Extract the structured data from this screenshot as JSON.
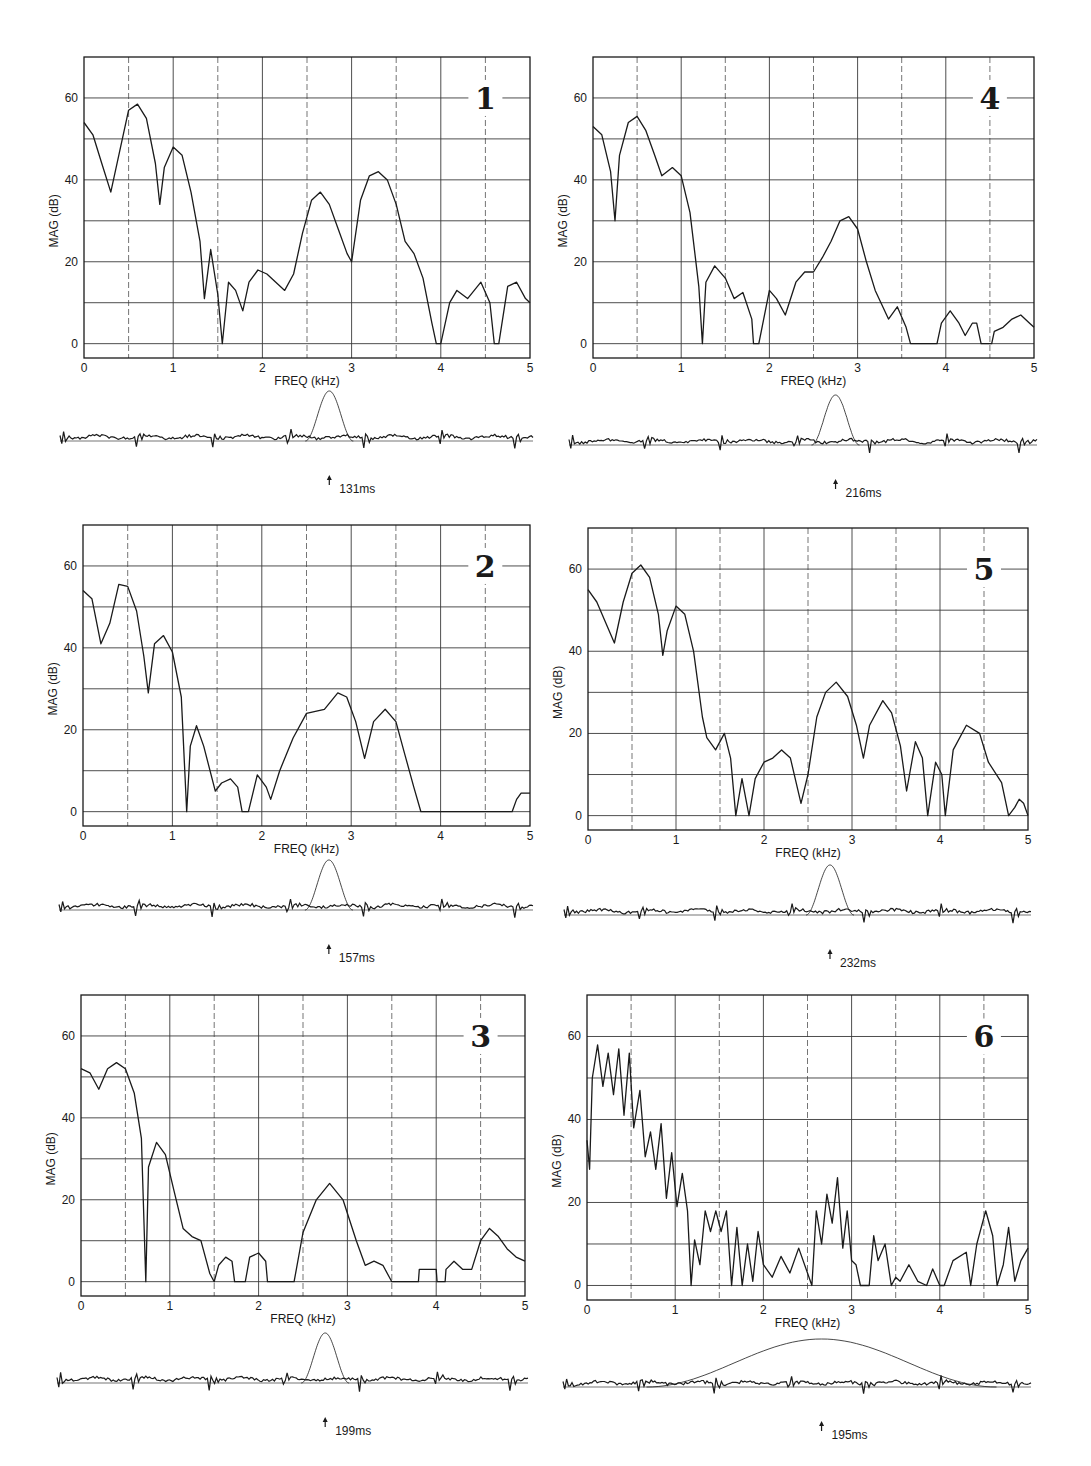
{
  "figure": {
    "x_axis_label": "FREQ (kHz)",
    "y_axis_label": "MAG  (dB)",
    "x_ticks": [
      "0",
      "1",
      "2",
      "3",
      "4",
      "5"
    ],
    "y_ticks": [
      "0",
      "20",
      "40",
      "60"
    ],
    "colors": {
      "ink": "#1a1a1a",
      "grid": "#3a3a3a",
      "background": "#ffffff"
    }
  },
  "chart_data": [
    {
      "type": "line",
      "panel": "1",
      "title": "1",
      "xlabel": "FREQ (kHz)",
      "ylabel": "MAG (dB)",
      "xlim": [
        0,
        5
      ],
      "ylim": [
        -3.5,
        70
      ],
      "x_ticks": [
        0,
        1,
        2,
        3,
        4,
        5
      ],
      "y_ticks": [
        0,
        20,
        40,
        60
      ],
      "grid": true,
      "x": [
        0,
        0.1,
        0.2,
        0.3,
        0.4,
        0.5,
        0.6,
        0.7,
        0.8,
        0.85,
        0.9,
        1.0,
        1.1,
        1.2,
        1.3,
        1.35,
        1.42,
        1.5,
        1.55,
        1.62,
        1.7,
        1.78,
        1.85,
        1.95,
        2.05,
        2.15,
        2.25,
        2.35,
        2.45,
        2.55,
        2.65,
        2.75,
        2.85,
        2.95,
        3.0,
        3.1,
        3.2,
        3.3,
        3.4,
        3.5,
        3.6,
        3.7,
        3.8,
        3.9,
        3.95,
        4.0,
        4.1,
        4.18,
        4.3,
        4.45,
        4.55,
        4.6,
        4.65,
        4.75,
        4.85,
        4.95,
        5.0
      ],
      "values": [
        54,
        51,
        44,
        37,
        47,
        57,
        58.5,
        55,
        44,
        34,
        43,
        48,
        46,
        37,
        25,
        11,
        23,
        12,
        0,
        15,
        13,
        8,
        15,
        18,
        17,
        15,
        13,
        17,
        27,
        35,
        37,
        34,
        28,
        22,
        20,
        35,
        41,
        42,
        40,
        34,
        25,
        22,
        16,
        5,
        0,
        0,
        10,
        13,
        11,
        15,
        10,
        0,
        0,
        14,
        15,
        11,
        10
      ],
      "annotation_time": "131ms"
    },
    {
      "type": "line",
      "panel": "2",
      "title": "2",
      "xlabel": "FREQ (kHz)",
      "ylabel": "MAG (dB)",
      "xlim": [
        0,
        5
      ],
      "ylim": [
        -3.5,
        70
      ],
      "x_ticks": [
        0,
        1,
        2,
        3,
        4,
        5
      ],
      "y_ticks": [
        0,
        20,
        40,
        60
      ],
      "grid": true,
      "x": [
        0,
        0.1,
        0.2,
        0.3,
        0.4,
        0.5,
        0.6,
        0.68,
        0.73,
        0.8,
        0.9,
        1.0,
        1.1,
        1.16,
        1.2,
        1.27,
        1.35,
        1.48,
        1.55,
        1.65,
        1.73,
        1.78,
        1.85,
        1.95,
        2.05,
        2.1,
        2.2,
        2.35,
        2.5,
        2.6,
        2.7,
        2.85,
        2.95,
        3.05,
        3.15,
        3.25,
        3.38,
        3.5,
        3.6,
        3.7,
        3.78,
        4.0,
        4.5,
        4.8,
        4.85,
        4.9,
        5.0
      ],
      "values": [
        54,
        52,
        41,
        46,
        55.5,
        55,
        49,
        38,
        29,
        41,
        43,
        39,
        28,
        0,
        16,
        21,
        16,
        5,
        7,
        8,
        6,
        0,
        0,
        9,
        6,
        3,
        10,
        18,
        24,
        24.5,
        25,
        29,
        28,
        22,
        13,
        22,
        25,
        22,
        14,
        6,
        0,
        0,
        0,
        0,
        3,
        4.5,
        4.5
      ],
      "annotation_time": "157ms"
    },
    {
      "type": "line",
      "panel": "3",
      "title": "3",
      "xlabel": "FREQ (kHz)",
      "ylabel": "MAG (dB)",
      "xlim": [
        0,
        5
      ],
      "ylim": [
        -3.5,
        70
      ],
      "x_ticks": [
        0,
        1,
        2,
        3,
        4,
        5
      ],
      "y_ticks": [
        0,
        20,
        40,
        60
      ],
      "grid": true,
      "x": [
        0,
        0.1,
        0.2,
        0.3,
        0.4,
        0.5,
        0.6,
        0.68,
        0.73,
        0.76,
        0.85,
        0.95,
        1.05,
        1.15,
        1.25,
        1.35,
        1.45,
        1.5,
        1.55,
        1.63,
        1.7,
        1.73,
        1.85,
        1.9,
        2.0,
        2.08,
        2.1,
        2.4,
        2.5,
        2.65,
        2.8,
        2.95,
        3.1,
        3.2,
        3.3,
        3.4,
        3.5,
        3.8,
        3.81,
        4.0,
        4.01,
        4.1,
        4.11,
        4.2,
        4.3,
        4.4,
        4.5,
        4.6,
        4.7,
        4.8,
        4.9,
        5.0
      ],
      "values": [
        52,
        51,
        47,
        52,
        53.5,
        52,
        46,
        35,
        0,
        28,
        34,
        31,
        22,
        13,
        11,
        10,
        2,
        0,
        4,
        6,
        5,
        0,
        0,
        6,
        7,
        5,
        0,
        0,
        12,
        20,
        24,
        20,
        10,
        4,
        5,
        4,
        0,
        0,
        3,
        3,
        0,
        0,
        3,
        5,
        3,
        3,
        10,
        13,
        11,
        8,
        6,
        5
      ],
      "annotation_time": "199ms"
    },
    {
      "type": "line",
      "panel": "4",
      "title": "4",
      "xlabel": "FREQ (kHz)",
      "ylabel": "MAG (dB)",
      "xlim": [
        0,
        5
      ],
      "ylim": [
        -3.5,
        70
      ],
      "x_ticks": [
        0,
        1,
        2,
        3,
        4,
        5
      ],
      "y_ticks": [
        0,
        20,
        40,
        60
      ],
      "grid": true,
      "x": [
        0,
        0.1,
        0.2,
        0.25,
        0.3,
        0.4,
        0.5,
        0.6,
        0.7,
        0.78,
        0.9,
        1.0,
        1.1,
        1.2,
        1.24,
        1.28,
        1.38,
        1.5,
        1.6,
        1.7,
        1.8,
        1.82,
        1.88,
        2.0,
        2.08,
        2.18,
        2.3,
        2.4,
        2.5,
        2.6,
        2.7,
        2.8,
        2.9,
        3.0,
        3.1,
        3.2,
        3.35,
        3.45,
        3.55,
        3.6,
        3.9,
        3.95,
        4.05,
        4.15,
        4.22,
        4.3,
        4.35,
        4.4,
        4.52,
        4.55,
        4.65,
        4.75,
        4.85,
        4.95,
        5.0
      ],
      "values": [
        53,
        51,
        42,
        30,
        46,
        54,
        55.5,
        52,
        46,
        41,
        43,
        41,
        32,
        14,
        0,
        15,
        19,
        16,
        11,
        12.5,
        6,
        0,
        0,
        13,
        11,
        7,
        15,
        17.5,
        17.5,
        21,
        25,
        30,
        31,
        28,
        20,
        13,
        6,
        9,
        4,
        0,
        0,
        5,
        8,
        5,
        2,
        5,
        5,
        0,
        0,
        3,
        4,
        6,
        7,
        5,
        4
      ],
      "annotation_time": "216ms"
    },
    {
      "type": "line",
      "panel": "5",
      "title": "5",
      "xlabel": "FREQ (kHz)",
      "ylabel": "MAG (dB)",
      "xlim": [
        0,
        5
      ],
      "ylim": [
        -3.5,
        70
      ],
      "x_ticks": [
        0,
        1,
        2,
        3,
        4,
        5
      ],
      "y_ticks": [
        0,
        20,
        40,
        60
      ],
      "grid": true,
      "x": [
        0,
        0.1,
        0.2,
        0.3,
        0.4,
        0.5,
        0.6,
        0.7,
        0.8,
        0.85,
        0.9,
        1.0,
        1.1,
        1.2,
        1.3,
        1.35,
        1.45,
        1.55,
        1.62,
        1.68,
        1.75,
        1.83,
        1.9,
        2.0,
        2.1,
        2.2,
        2.3,
        2.42,
        2.5,
        2.6,
        2.7,
        2.82,
        2.95,
        3.05,
        3.13,
        3.2,
        3.35,
        3.45,
        3.55,
        3.62,
        3.72,
        3.8,
        3.86,
        3.95,
        4.02,
        4.06,
        4.15,
        4.3,
        4.45,
        4.55,
        4.7,
        4.78,
        4.85,
        4.9,
        4.95,
        5.0
      ],
      "values": [
        55,
        52,
        47,
        42,
        52,
        59,
        61,
        58,
        49,
        39,
        45,
        51,
        49,
        40,
        24,
        19,
        16,
        20,
        14,
        0,
        9,
        0,
        9,
        13,
        14,
        16,
        14,
        3,
        10,
        24,
        30,
        32.5,
        29,
        22,
        14,
        22,
        28,
        25,
        17,
        6,
        18,
        14,
        0,
        13,
        10,
        0,
        16,
        22,
        20,
        13,
        8,
        0,
        2,
        4,
        3,
        0
      ],
      "annotation_time": "232ms"
    },
    {
      "type": "line",
      "panel": "6",
      "title": "6",
      "xlabel": "FREQ (kHz)",
      "ylabel": "MAG (dB)",
      "xlim": [
        0,
        5
      ],
      "ylim": [
        -3.5,
        70
      ],
      "x_ticks": [
        0,
        1,
        2,
        3,
        4,
        5
      ],
      "y_ticks": [
        0,
        20,
        40,
        60
      ],
      "grid": true,
      "x": [
        0,
        0.03,
        0.06,
        0.12,
        0.18,
        0.24,
        0.3,
        0.36,
        0.42,
        0.48,
        0.53,
        0.6,
        0.66,
        0.72,
        0.78,
        0.84,
        0.9,
        0.96,
        1.02,
        1.08,
        1.14,
        1.18,
        1.22,
        1.28,
        1.34,
        1.4,
        1.46,
        1.52,
        1.58,
        1.64,
        1.7,
        1.76,
        1.82,
        1.88,
        1.94,
        2.0,
        2.1,
        2.2,
        2.3,
        2.4,
        2.5,
        2.55,
        2.6,
        2.66,
        2.72,
        2.78,
        2.84,
        2.9,
        2.95,
        3.0,
        3.05,
        3.1,
        3.2,
        3.25,
        3.3,
        3.38,
        3.45,
        3.5,
        3.55,
        3.65,
        3.75,
        3.85,
        3.92,
        4.0,
        4.05,
        4.15,
        4.3,
        4.35,
        4.42,
        4.52,
        4.6,
        4.65,
        4.72,
        4.78,
        4.85,
        4.92,
        5.0
      ],
      "values": [
        35,
        28,
        50,
        58,
        48,
        56,
        46,
        57,
        41,
        56,
        38,
        47,
        31,
        37,
        28,
        39,
        21,
        32,
        19,
        27,
        18,
        0,
        11,
        5,
        18,
        13,
        18,
        13,
        18,
        0,
        14,
        0,
        10,
        1,
        13,
        5,
        2,
        7,
        3,
        9,
        3,
        0,
        18,
        10,
        22,
        15,
        26,
        9,
        18,
        6,
        5,
        0,
        0,
        12,
        6,
        10,
        0,
        2,
        1,
        5,
        1,
        0,
        4,
        0,
        0,
        6,
        8,
        0,
        10,
        18,
        12,
        0,
        5,
        14,
        1,
        6,
        9
      ],
      "annotation_time": "195ms"
    }
  ],
  "panels": [
    {
      "id": "1",
      "label": "1",
      "time": "131ms",
      "column": "left",
      "row": 0
    },
    {
      "id": "2",
      "label": "2",
      "time": "157ms",
      "column": "left",
      "row": 1
    },
    {
      "id": "3",
      "label": "3",
      "time": "199ms",
      "column": "left",
      "row": 2
    },
    {
      "id": "4",
      "label": "4",
      "time": "216ms",
      "column": "right",
      "row": 0
    },
    {
      "id": "5",
      "label": "5",
      "time": "232ms",
      "column": "right",
      "row": 1
    },
    {
      "id": "6",
      "label": "6",
      "time": "195ms",
      "column": "right",
      "row": 2
    }
  ]
}
